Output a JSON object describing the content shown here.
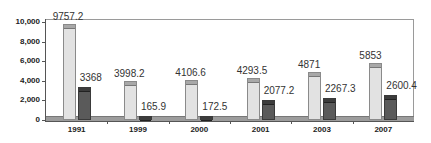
{
  "chart_data": {
    "type": "bar",
    "title": "",
    "xlabel": "",
    "ylabel": "",
    "categories": [
      "1991",
      "1999",
      "2000",
      "2001",
      "2003",
      "2007"
    ],
    "series": [
      {
        "name": "Series 1",
        "color": "#e2e2e2",
        "values": [
          9757.2,
          3998.2,
          4106.6,
          4293.5,
          4871,
          5853
        ]
      },
      {
        "name": "Series 2",
        "color": "#5a5a5a",
        "values": [
          3368,
          165.9,
          172.5,
          2077.2,
          2267.3,
          2600.4
        ]
      }
    ],
    "data_labels": {
      "series1": [
        "9757.2",
        "3998.2",
        "4106.6",
        "4293.5",
        "4871",
        "5853"
      ],
      "series2": [
        "3368",
        "165.9",
        "172.5",
        "2077.2",
        "2267.3",
        "2600.4"
      ]
    },
    "yticks": [
      "0",
      "2,000",
      "4,000",
      "6,000",
      "8,000",
      "10,000"
    ],
    "ylim": [
      0,
      10000
    ],
    "grid": false,
    "legend": "none"
  }
}
